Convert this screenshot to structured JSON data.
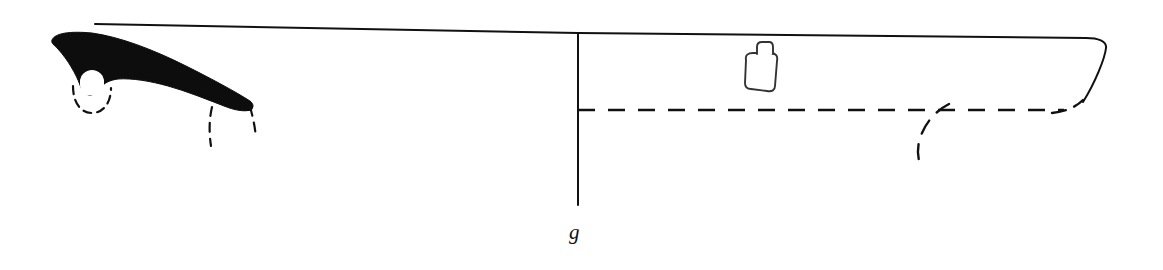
{
  "figure": {
    "label": "g",
    "caption": "",
    "type": "archaeological-vessel-profile",
    "canvas": {
      "width": 1163,
      "height": 270,
      "background_color": "#ffffff"
    },
    "colors": {
      "ink": "#111111",
      "fill_section": "#0d0d0d",
      "background": "#ffffff"
    },
    "line_weights": {
      "rim_line": 2.0,
      "axis_line": 2.0,
      "outline": 2.0,
      "dashed": 2.4
    },
    "elements": {
      "section_fill": {
        "name": "black-section-fill",
        "path": "M 52 40 C 55 33 70 31 92 33 C 120 37 152 49 186 66 C 212 79 236 92 250 101 C 254 104 254 108 250 110 C 244 112 234 110 224 106 C 206 99 186 91 168 86 C 150 81 132 78 118 79 C 110 80 104 83 100 88 C 97 92 94 95 90 95 C 85 95 82 91 80 85 C 76 74 68 60 58 49 C 54 45 51 43 52 40 Z"
      },
      "notch_circle": {
        "name": "white-notch-circle",
        "cx": 92,
        "cy": 82,
        "r": 12,
        "fill": "#ffffff"
      },
      "dashed_arc_left": {
        "name": "dashed-arc-left",
        "path": "M 74 88 C 74 104 82 112 92 112 C 102 112 110 104 110 90",
        "dasharray": "8 6"
      },
      "dashed_arc_right_inner": {
        "name": "dashed-arc-right-inner",
        "path": "M 212 108 C 210 122 210 134 212 146",
        "dasharray": "8 6"
      },
      "dashed_arc_right_outer": {
        "name": "dashed-arc-right-outer",
        "path": "M 251 108 C 253 118 255 128 256 138",
        "dasharray": "8 6"
      },
      "rim_line_left": {
        "name": "rim-line-left-segment",
        "x1": 95,
        "y1": 24,
        "x2": 578,
        "y2": 33
      },
      "rim_line_right": {
        "name": "rim-line-right-segment",
        "path": "M 578 33 L 1086 38 C 1098 38 1106 41 1106 47 C 1106 56 1096 82 1083 102"
      },
      "axis_line": {
        "name": "vertical-axis-line",
        "x1": 578,
        "y1": 33,
        "x2": 578,
        "y2": 205
      },
      "dashed_interior_line": {
        "name": "dashed-interior-line",
        "x1": 578,
        "y1": 110,
        "x2": 1070,
        "y2": 110,
        "dasharray": "16 12"
      },
      "dashed_right_end_curve": {
        "name": "dashed-right-end-curve",
        "path": "M 1056 113 C 1068 112 1078 107 1083 101",
        "dasharray": "14 10"
      },
      "dashed_hook_curve": {
        "name": "dashed-interior-hook-curve",
        "path": "M 946 105 C 936 112 926 122 921 134 C 917 144 917 154 919 163",
        "dasharray": "14 11"
      },
      "lug_body": {
        "name": "lug-body-outline",
        "path": "M 746 58 C 745 54 748 52 753 52 L 770 52 C 775 52 777 54 776 59 L 775 86 C 775 90 772 92 767 91 L 751 90 C 747 90 745 88 745 84 Z"
      },
      "lug_tab": {
        "name": "lug-tab-outline",
        "path": "M 756 53 L 757 46 C 757 43 759 42 762 42 L 768 42 C 771 42 772 44 772 47 L 772 53"
      }
    }
  }
}
